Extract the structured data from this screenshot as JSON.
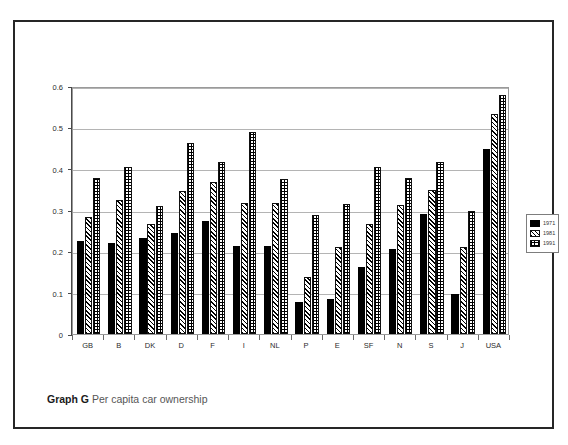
{
  "caption": {
    "label": "Graph G",
    "text": "Per capita car ownership"
  },
  "legend": {
    "position": "right",
    "entries": [
      {
        "name": "1971",
        "pattern": "solid-black"
      },
      {
        "name": "1981",
        "pattern": "diagonal-hatch"
      },
      {
        "name": "1991",
        "pattern": "crosshatch-grid"
      }
    ]
  },
  "chart_data": {
    "type": "bar",
    "title": "Per capita car ownership",
    "xlabel": "",
    "ylabel": "",
    "ylim": [
      0,
      0.6
    ],
    "yticks": [
      "0",
      "0.1",
      "0.2",
      "0.3",
      "0.4",
      "0.5",
      "0.6"
    ],
    "ytick_values": [
      0,
      0.1,
      0.2,
      0.3,
      0.4,
      0.5,
      0.6
    ],
    "grid": true,
    "legend_position": "right",
    "categories": [
      "GB",
      "B",
      "DK",
      "D",
      "F",
      "I",
      "NL",
      "P",
      "E",
      "SF",
      "N",
      "S",
      "J",
      "USA"
    ],
    "series": [
      {
        "name": "1971",
        "values": [
          0.225,
          0.221,
          0.232,
          0.244,
          0.274,
          0.213,
          0.213,
          0.077,
          0.084,
          0.163,
          0.206,
          0.29,
          0.098,
          0.447
        ]
      },
      {
        "name": "1981",
        "values": [
          0.283,
          0.324,
          0.266,
          0.345,
          0.368,
          0.318,
          0.318,
          0.137,
          0.211,
          0.267,
          0.312,
          0.348,
          0.211,
          0.532
        ]
      },
      {
        "name": "1991",
        "values": [
          0.377,
          0.404,
          0.309,
          0.461,
          0.415,
          0.488,
          0.375,
          0.287,
          0.315,
          0.403,
          0.378,
          0.417,
          0.297,
          0.578
        ]
      }
    ]
  }
}
